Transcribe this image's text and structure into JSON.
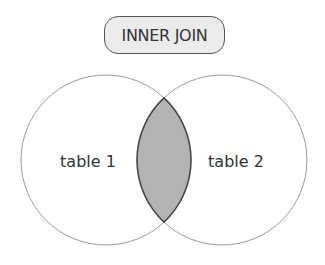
{
  "title": "INNER JOIN",
  "diagram": {
    "type": "venn",
    "sets": [
      {
        "id": "left",
        "label": "table 1"
      },
      {
        "id": "right",
        "label": "table 2"
      }
    ],
    "highlighted_region": "intersection",
    "colors": {
      "circle_stroke": "#9a9a9a",
      "intersection_fill": "#b3b3b3",
      "intersection_stroke": "#444444",
      "label_text": "#333333",
      "title_fill": "#ebebeb",
      "title_border": "#555555"
    }
  }
}
